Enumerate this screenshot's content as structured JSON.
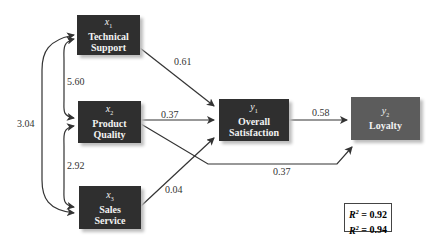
{
  "nodes": {
    "x1": {
      "var": "x",
      "sub": "1",
      "line1": "Technical",
      "line2": "Support"
    },
    "x2": {
      "var": "x",
      "sub": "2",
      "line1": "Product",
      "line2": "Quality"
    },
    "x3": {
      "var": "x",
      "sub": "3",
      "line1": "Sales",
      "line2": "Service"
    },
    "y1": {
      "var": "y",
      "sub": "1",
      "line1": "Overall",
      "line2": "Satisfaction"
    },
    "y2": {
      "var": "y",
      "sub": "2",
      "line1": "Loyalty"
    }
  },
  "paths": {
    "x1_y1": "0.61",
    "x2_y1": "0.37",
    "x3_y1": "0.04",
    "y1_y2": "0.58",
    "x2_y2": "0.37"
  },
  "covariances": {
    "x1_x2": "5.60",
    "x2_x3": "2.92",
    "x1_x3": "3.04"
  },
  "r_squared": {
    "label": "R",
    "sup": "2",
    "line1": " = 0.92",
    "line2": " = 0.94"
  },
  "colors": {
    "dark_box": "#2f2f2f",
    "light_box": "#5c5c5c",
    "arrow": "#333333"
  }
}
